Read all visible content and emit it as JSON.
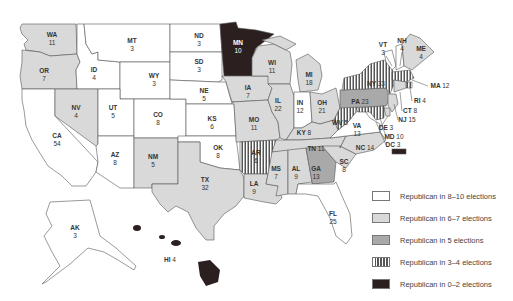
{
  "map": {
    "type": "choropleth",
    "subject": "United States electoral votes by state, shaded by number of elections voted Republican",
    "colors": {
      "republican_8_10": "#ffffff",
      "republican_6_7": "#d9d9d9",
      "republican_5": "#a9a9a9",
      "republican_3_4": "striped",
      "republican_0_2": "#2b1f1f"
    },
    "states": [
      {
        "abbr": "WA",
        "votes": "11",
        "category": "republican_6_7"
      },
      {
        "abbr": "OR",
        "votes": "7",
        "category": "republican_6_7"
      },
      {
        "abbr": "CA",
        "votes": "54",
        "category": "republican_8_10"
      },
      {
        "abbr": "ID",
        "votes": "4",
        "category": "republican_8_10"
      },
      {
        "abbr": "NV",
        "votes": "4",
        "category": "republican_6_7"
      },
      {
        "abbr": "MT",
        "votes": "3",
        "category": "republican_8_10"
      },
      {
        "abbr": "WY",
        "votes": "3",
        "category": "republican_8_10"
      },
      {
        "abbr": "UT",
        "votes": "5",
        "category": "republican_8_10"
      },
      {
        "abbr": "AZ",
        "votes": "8",
        "category": "republican_8_10"
      },
      {
        "abbr": "CO",
        "votes": "8",
        "category": "republican_8_10"
      },
      {
        "abbr": "NM",
        "votes": "5",
        "category": "republican_6_7"
      },
      {
        "abbr": "ND",
        "votes": "3",
        "category": "republican_8_10"
      },
      {
        "abbr": "SD",
        "votes": "3",
        "category": "republican_8_10"
      },
      {
        "abbr": "NE",
        "votes": "5",
        "category": "republican_8_10"
      },
      {
        "abbr": "KS",
        "votes": "6",
        "category": "republican_8_10"
      },
      {
        "abbr": "OK",
        "votes": "8",
        "category": "republican_8_10"
      },
      {
        "abbr": "TX",
        "votes": "32",
        "category": "republican_6_7"
      },
      {
        "abbr": "MN",
        "votes": "10",
        "category": "republican_0_2"
      },
      {
        "abbr": "IA",
        "votes": "7",
        "category": "republican_6_7"
      },
      {
        "abbr": "MO",
        "votes": "11",
        "category": "republican_6_7"
      },
      {
        "abbr": "AR",
        "votes": "6",
        "category": "republican_3_4"
      },
      {
        "abbr": "LA",
        "votes": "9",
        "category": "republican_6_7"
      },
      {
        "abbr": "WI",
        "votes": "11",
        "category": "republican_6_7"
      },
      {
        "abbr": "IL",
        "votes": "22",
        "category": "republican_6_7"
      },
      {
        "abbr": "MI",
        "votes": "18",
        "category": "republican_6_7"
      },
      {
        "abbr": "IN",
        "votes": "12",
        "category": "republican_8_10"
      },
      {
        "abbr": "OH",
        "votes": "21",
        "category": "republican_6_7"
      },
      {
        "abbr": "KY",
        "votes": "8",
        "category": "republican_6_7"
      },
      {
        "abbr": "TN",
        "votes": "11",
        "category": "republican_6_7"
      },
      {
        "abbr": "MS",
        "votes": "7",
        "category": "republican_6_7"
      },
      {
        "abbr": "AL",
        "votes": "9",
        "category": "republican_6_7"
      },
      {
        "abbr": "GA",
        "votes": "13",
        "category": "republican_5"
      },
      {
        "abbr": "FL",
        "votes": "25",
        "category": "republican_8_10"
      },
      {
        "abbr": "SC",
        "votes": "8",
        "category": "republican_6_7"
      },
      {
        "abbr": "NC",
        "votes": "14",
        "category": "republican_6_7"
      },
      {
        "abbr": "VA",
        "votes": "13",
        "category": "republican_8_10"
      },
      {
        "abbr": "WV",
        "votes": "5",
        "category": "republican_3_4"
      },
      {
        "abbr": "PA",
        "votes": "23",
        "category": "republican_5"
      },
      {
        "abbr": "NY",
        "votes": "33",
        "category": "republican_3_4"
      },
      {
        "abbr": "VT",
        "votes": "3",
        "category": "republican_8_10"
      },
      {
        "abbr": "NH",
        "votes": "4",
        "category": "republican_8_10"
      },
      {
        "abbr": "ME",
        "votes": "4",
        "category": "republican_6_7"
      },
      {
        "abbr": "MA",
        "votes": "12",
        "category": "republican_3_4"
      },
      {
        "abbr": "RI",
        "votes": "4",
        "category": "republican_3_4"
      },
      {
        "abbr": "CT",
        "votes": "8",
        "category": "republican_6_7"
      },
      {
        "abbr": "NJ",
        "votes": "15",
        "category": "republican_6_7"
      },
      {
        "abbr": "DE",
        "votes": "3",
        "category": "republican_6_7"
      },
      {
        "abbr": "MD",
        "votes": "10",
        "category": "republican_3_4"
      },
      {
        "abbr": "DC",
        "votes": "3",
        "category": "republican_0_2"
      },
      {
        "abbr": "AK",
        "votes": "3",
        "category": "republican_8_10"
      },
      {
        "abbr": "HI",
        "votes": "4",
        "category": "republican_0_2"
      }
    ]
  },
  "legend": {
    "items": [
      {
        "label": "Republican in 8–10 elections"
      },
      {
        "label": "Republican in 6–7 elections"
      },
      {
        "label": "Republican in 5 elections"
      },
      {
        "label": "Republican in 3–4 elections"
      },
      {
        "label": "Republican in 0–2 elections"
      }
    ]
  }
}
